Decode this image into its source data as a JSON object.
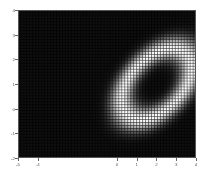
{
  "figure": {
    "title": "",
    "background_color": "#ffffff",
    "plot_background_color": "#000000",
    "spine_color": "#555555",
    "tick_color": "#666666",
    "label_color": "#5a5a5a"
  },
  "axes": {
    "x_tick_labels": [
      "-5",
      "-4",
      "0",
      "1",
      "2",
      "3",
      "4"
    ],
    "y_tick_labels": [
      "4",
      "3",
      "2",
      "1",
      "0",
      "-1",
      "-2"
    ]
  },
  "chart_data": {
    "type": "heatmap",
    "title": "",
    "xlabel": "",
    "ylabel": "",
    "xlim": [
      -5,
      4
    ],
    "ylim": [
      -2,
      4
    ],
    "xticks": [
      -5,
      -4,
      0,
      1,
      2,
      3,
      4
    ],
    "yticks": [
      4,
      3,
      2,
      1,
      0,
      -1,
      -2
    ],
    "xtick_labels": [
      "-5",
      "-4",
      "0",
      "1",
      "2",
      "3",
      "4"
    ],
    "ytick_labels": [
      "4",
      "3",
      "2",
      "1",
      "0",
      "-1",
      "-2"
    ],
    "grid": true,
    "mesh_grid": true,
    "mesh_cols": 60,
    "mesh_rows": 50,
    "colormap": "gray",
    "colormap_stops": [
      "#000000",
      "#ffffff"
    ],
    "zlim": [
      0,
      1
    ],
    "legend": "none",
    "colorbar": false,
    "annotations": [],
    "feature": {
      "shape": "elliptical-annulus",
      "center_x": 2.0,
      "center_y": 1.0,
      "ring_radius": 1.15,
      "ring_thickness": 0.55,
      "semi_major": 1.95,
      "semi_minor": 1.15,
      "rotation_deg": 33,
      "peak_value": 1.0,
      "core_value": 0.08,
      "background_value": 0.05
    }
  }
}
